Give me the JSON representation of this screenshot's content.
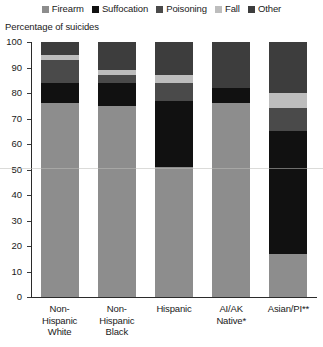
{
  "legend": {
    "items": [
      {
        "label": "Firearm",
        "color": "#8d8d8d"
      },
      {
        "label": "Suffocation",
        "color": "#111111"
      },
      {
        "label": "Poisoning",
        "color": "#4a4a4a"
      },
      {
        "label": "Fall",
        "color": "#bdbdbd"
      },
      {
        "label": "Other",
        "color": "#3d3d3d"
      }
    ]
  },
  "axis_title": "Percentage of suicides",
  "chart_data": {
    "type": "bar",
    "stacked": true,
    "title": "",
    "subtitle": "",
    "xlabel": "",
    "ylabel": "Percentage of suicides",
    "ylim": [
      0,
      100
    ],
    "yticks": [
      0,
      10,
      20,
      30,
      40,
      50,
      60,
      70,
      80,
      90,
      100
    ],
    "ytick_labels": [
      "0",
      "10",
      "20",
      "30",
      "40",
      "50",
      "60",
      "70",
      "80",
      "90",
      "100"
    ],
    "grid": false,
    "legend_position": "top",
    "categories": [
      "Non-Hispanic White",
      "Non-Hispanic Black",
      "Hispanic",
      "AI/AK Native*",
      "Asian/PI**"
    ],
    "category_label_lines": [
      [
        "Non-",
        "Hispanic",
        "White"
      ],
      [
        "Non-",
        "Hispanic",
        "Black"
      ],
      [
        "Hispanic"
      ],
      [
        "AI/AK",
        "Native*"
      ],
      [
        "Asian/PI**"
      ]
    ],
    "series": [
      {
        "name": "Firearm",
        "color": "#8d8d8d",
        "values": [
          76,
          75,
          51,
          76,
          17
        ]
      },
      {
        "name": "Suffocation",
        "color": "#111111",
        "values": [
          8,
          9,
          26,
          6,
          48
        ]
      },
      {
        "name": "Poisoning",
        "color": "#4a4a4a",
        "values": [
          9,
          3,
          7,
          0,
          9
        ]
      },
      {
        "name": "Fall",
        "color": "#bdbdbd",
        "values": [
          2,
          2,
          3,
          0,
          6
        ]
      },
      {
        "name": "Other",
        "color": "#3d3d3d",
        "values": [
          5,
          11,
          13,
          18,
          20
        ]
      }
    ],
    "footnotes": [
      "*",
      "**"
    ]
  }
}
